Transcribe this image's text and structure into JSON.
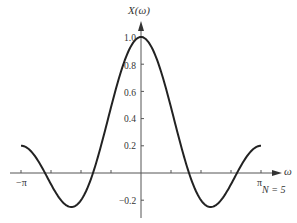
{
  "chart_data": {
    "type": "line",
    "title": "",
    "xlabel": "ω",
    "ylabel": "X(ω)",
    "annotation": "N = 5",
    "function": "X(ω) = sin(Nω/2) / (N sin(ω/2)), N = 5",
    "xlim": [
      -3.14159,
      3.14159
    ],
    "ylim": [
      -0.3,
      1.05
    ],
    "x_tick_labels": [
      "-π",
      "π"
    ],
    "x_ticks_count": 9,
    "y_tick_labels": [
      "1.0",
      "0.8",
      "0.6",
      "0.4",
      "0.2",
      "-0.2"
    ],
    "y_ticks": [
      1.0,
      0.8,
      0.6,
      0.4,
      0.2,
      -0.2
    ],
    "grid": false,
    "series": [
      {
        "name": "X(ω)",
        "x": [
          -3.1416,
          -2.3562,
          -1.885,
          -1.5708,
          -1.2566,
          -0.7854,
          -0.3927,
          0,
          0.3927,
          0.7854,
          1.2566,
          1.5708,
          1.885,
          2.3562,
          3.1416
        ],
        "values": [
          0.2,
          -0.08,
          -0.25,
          -0.2,
          0.0,
          0.52,
          0.88,
          1.0,
          0.88,
          0.52,
          0.0,
          -0.2,
          -0.25,
          -0.08,
          0.2
        ]
      }
    ]
  },
  "labels": {
    "y_axis": "X(ω)",
    "x_axis": "ω",
    "n_note": "N = 5",
    "neg_pi": "−π",
    "pi": "π",
    "y1": "1.0",
    "y08": "0.8",
    "y06": "0.6",
    "y04": "0.4",
    "y02": "0.2",
    "ym02": "−0.2"
  }
}
